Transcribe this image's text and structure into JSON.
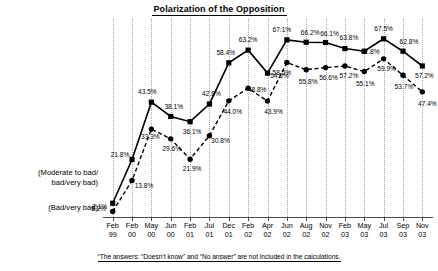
{
  "chart_data": {
    "type": "line",
    "title": "Polarization of the Opposition",
    "xlabel": "",
    "ylabel": "",
    "ylim": [
      0,
      75
    ],
    "grid": true,
    "legend_position": "left-axis-captions",
    "categories": [
      "Feb 99",
      "Feb 00",
      "May 00",
      "Jun 00",
      "Feb 01",
      "Jul 01",
      "Dec 01",
      "Feb 02",
      "Apr 02",
      "Jun 02",
      "Aug 02",
      "Nov 02",
      "Feb 03",
      "May 03",
      "Jul 03",
      "Sep 03",
      "Nov 03"
    ],
    "categories_split": [
      {
        "month": "Feb",
        "year": "99"
      },
      {
        "month": "Feb",
        "year": "00"
      },
      {
        "month": "May",
        "year": "00"
      },
      {
        "month": "Jun",
        "year": "00"
      },
      {
        "month": "Feb",
        "year": "01"
      },
      {
        "month": "Jul",
        "year": "01"
      },
      {
        "month": "Dec",
        "year": "01"
      },
      {
        "month": "Feb",
        "year": "02"
      },
      {
        "month": "Apr",
        "year": "02"
      },
      {
        "month": "Jun",
        "year": "02"
      },
      {
        "month": "Aug",
        "year": "02"
      },
      {
        "month": "Nov",
        "year": "02"
      },
      {
        "month": "Feb",
        "year": "03"
      },
      {
        "month": "May",
        "year": "03"
      },
      {
        "month": "Jul",
        "year": "03"
      },
      {
        "month": "Sep",
        "year": "03"
      },
      {
        "month": "Nov",
        "year": "03"
      }
    ],
    "series": [
      {
        "name": "(Moderate to bad/bad/very bad)",
        "marker": "square",
        "linestyle": "solid",
        "color": "#000000",
        "values": [
          5.2,
          21.8,
          43.5,
          38.1,
          36.1,
          42.8,
          58.4,
          63.2,
          54.5,
          67.1,
          66.2,
          66.1,
          63.8,
          62.8,
          67.5,
          62.8,
          57.2
        ],
        "labels": [
          "5.2%",
          "21.8%",
          "43.5%",
          "38.1%",
          "36.1%",
          "42.8%",
          "58.4%",
          "63.2%",
          "54.5%",
          "67.1%",
          "66.2%",
          "66.1%",
          "63.8%",
          "62.8%",
          "67.5%",
          "62.8%",
          "57.2%"
        ]
      },
      {
        "name": "(Bad/very bad)",
        "marker": "circle",
        "linestyle": "dashed",
        "color": "#000000",
        "values": [
          2.1,
          13.8,
          33.3,
          29.6,
          21.9,
          30.8,
          44.0,
          48.8,
          43.9,
          58.5,
          55.8,
          56.6,
          57.2,
          55.1,
          59.9,
          53.7,
          47.4
        ],
        "labels": [
          "2.1%",
          "13.8%",
          "33.3%",
          "29.6%",
          "21.9%",
          "30.8%",
          "44.0%",
          "48.8%",
          "43.9%",
          "58.5%",
          "55.8%",
          "56.6%",
          "57.2%",
          "55.1%",
          "59.9%",
          "53.7%",
          "47.4%"
        ]
      }
    ]
  },
  "axis_captions": {
    "moderate_line1": "(Moderate to bad/",
    "moderate_line2": "bad/very bad)",
    "bad": "(Bad/very bad)"
  },
  "footnote": {
    "text": "“The answers: “Doesn’t know” and “No answer” are not included in the calculations."
  },
  "label_offsets": {
    "series0": [
      {
        "dx": -14,
        "dy": 6
      },
      {
        "dx": -12,
        "dy": -4
      },
      {
        "dx": -4,
        "dy": -10
      },
      {
        "dx": 3,
        "dy": -9
      },
      {
        "dx": 2,
        "dy": 10
      },
      {
        "dx": 2,
        "dy": -10
      },
      {
        "dx": -3,
        "dy": -10
      },
      {
        "dx": 0,
        "dy": -10
      },
      {
        "dx": 12,
        "dy": 3
      },
      {
        "dx": -5,
        "dy": -10
      },
      {
        "dx": 4,
        "dy": -9
      },
      {
        "dx": 4,
        "dy": -9
      },
      {
        "dx": 4,
        "dy": -11
      },
      {
        "dx": 6,
        "dy": 1
      },
      {
        "dx": 0,
        "dy": -10
      },
      {
        "dx": 6,
        "dy": -9
      },
      {
        "dx": 2,
        "dy": 10
      }
    ],
    "series1": [
      {
        "dx": -13,
        "dy": -4
      },
      {
        "dx": 12,
        "dy": 5
      },
      {
        "dx": -1,
        "dy": 8
      },
      {
        "dx": 1,
        "dy": 10
      },
      {
        "dx": 2,
        "dy": 10
      },
      {
        "dx": 11,
        "dy": 5
      },
      {
        "dx": 4,
        "dy": 11
      },
      {
        "dx": 9,
        "dy": 2
      },
      {
        "dx": 6,
        "dy": 11
      },
      {
        "dx": -5,
        "dy": 10
      },
      {
        "dx": 2,
        "dy": 12
      },
      {
        "dx": 3,
        "dy": 10
      },
      {
        "dx": 4,
        "dy": 10
      },
      {
        "dx": 1,
        "dy": 12
      },
      {
        "dx": 3,
        "dy": 10
      },
      {
        "dx": 1,
        "dy": 12
      },
      {
        "dx": 5,
        "dy": 12
      }
    ]
  }
}
